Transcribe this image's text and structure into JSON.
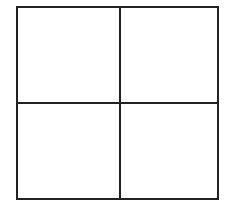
{
  "diagram": {
    "type": "2x2-grid",
    "rows": 2,
    "columns": 2,
    "line_color": "#222222",
    "background_color": "#ffffff",
    "cells": [
      {
        "position": "top-left",
        "label": ""
      },
      {
        "position": "top-right",
        "label": ""
      },
      {
        "position": "bottom-left",
        "label": ""
      },
      {
        "position": "bottom-right",
        "label": ""
      }
    ]
  }
}
